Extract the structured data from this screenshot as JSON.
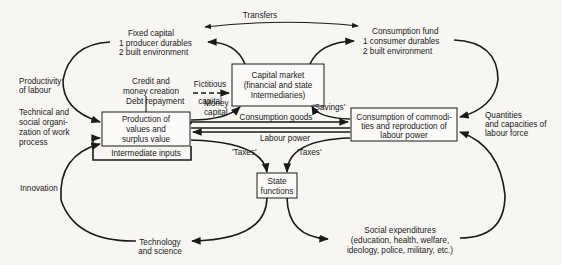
{
  "diagram": {
    "type": "flow-diagram",
    "nodes": {
      "fixed_capital": {
        "title": "Fixed capital",
        "items": [
          "1  producer durables",
          "2  built environment"
        ]
      },
      "consumption_fund": {
        "title": "Consumption fund",
        "items": [
          "1  consumer durables",
          "2  built environment"
        ]
      },
      "capital_market": {
        "lines": [
          "Capital market",
          "(financial and state",
          "Intermediaries)"
        ]
      },
      "production": {
        "lines": [
          "Production of",
          "values and",
          "surplus value"
        ]
      },
      "intermediate_inputs": {
        "label": "Intermediate inputs"
      },
      "consumption_reproduction": {
        "lines": [
          "Consumption of commodi-",
          "ties and reproduction of",
          "labour power"
        ]
      },
      "state_functions": {
        "lines": [
          "State",
          "functions"
        ]
      },
      "technology": {
        "lines": [
          "Technology",
          "and science"
        ]
      },
      "social_expenditures": {
        "lines": [
          "Social expenditures",
          "(education, health, welfare,",
          "ideology, police, military, etc.)"
        ]
      }
    },
    "labels": {
      "transfers": "Transfers",
      "productivity": [
        "Productivity",
        "of labour"
      ],
      "technical": [
        "Technical and",
        "social organi-",
        "zation of work",
        "process"
      ],
      "credit": [
        "Credit and",
        "money creation"
      ],
      "fictitious": [
        "Fictitious",
        "capital"
      ],
      "debt_repayment": "Debt repayment",
      "money_capital": [
        "Money",
        "capital"
      ],
      "savings": "'Savings'",
      "consumption_goods": "Consumption goods",
      "labour_power": "Labour power",
      "taxes_left": "'Taxes'",
      "taxes_right": "'Taxes'",
      "quantities": [
        "Quantities",
        "and capacities of",
        "labour force"
      ],
      "innovation": "Innovation"
    }
  }
}
